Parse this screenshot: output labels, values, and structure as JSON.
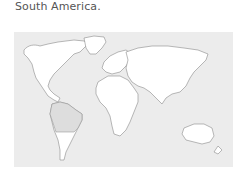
{
  "caption": {
    "text": "South America."
  },
  "map": {
    "type": "world-outline-map",
    "highlighted_region": "South America",
    "colors": {
      "background": "#ececec",
      "land": "#ffffff",
      "outline": "#8a8a8a",
      "highlight": "#dddddd"
    }
  }
}
